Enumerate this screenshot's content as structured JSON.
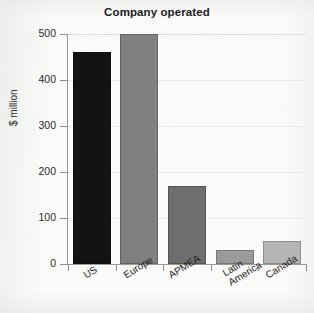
{
  "chart_data": {
    "type": "bar",
    "title": "Company operated",
    "xlabel": "",
    "ylabel": "$ million",
    "categories": [
      "US",
      "Europe",
      "APMEA",
      "Latin America",
      "Canada"
    ],
    "category_lines": [
      [
        "US"
      ],
      [
        "Europe"
      ],
      [
        "APMEA"
      ],
      [
        "Latin",
        "America"
      ],
      [
        "Canada"
      ]
    ],
    "values": [
      460,
      500,
      170,
      30,
      50
    ],
    "ylim": [
      0,
      500
    ],
    "yticks": [
      0,
      100,
      200,
      300,
      400,
      500
    ],
    "ytick_labels": [
      "0",
      "100",
      "200",
      "300",
      "400",
      "500"
    ],
    "grid": true,
    "legend": false,
    "bar_colors": [
      "#131313",
      "#808080",
      "#6e6e6e",
      "#9a9a9a",
      "#b5b5b5"
    ]
  },
  "colors": {
    "axis": "#9a9a9a",
    "grid": "#e9e9e7",
    "text": "#232323",
    "background": "#fbfbfa"
  }
}
